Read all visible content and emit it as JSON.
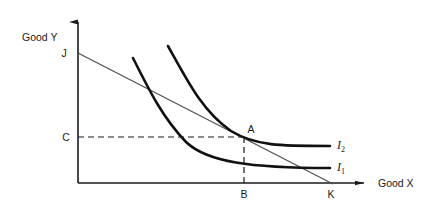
{
  "figure": {
    "type": "economics-indifference-curve-diagram",
    "background_color": "#ffffff",
    "line_color": "#1a1a1a",
    "curve_color": "#111111",
    "budget_line_color": "#555555"
  },
  "axes": {
    "y_axis_label": "Good Y",
    "x_axis_label": "Good X",
    "origin": {
      "x": 78,
      "y": 183
    },
    "y_axis_top": 14,
    "x_axis_right": 372
  },
  "points": [
    {
      "id": "J",
      "label": "J",
      "desc": "budget-line y-intercept",
      "x": 78,
      "y": 53
    },
    {
      "id": "K",
      "label": "K",
      "desc": "budget-line x-intercept",
      "x": 332,
      "y": 183
    },
    {
      "id": "A",
      "label": "A",
      "desc": "tangency of budget line with I2",
      "x": 244,
      "y": 137
    },
    {
      "id": "B",
      "label": "B",
      "desc": "x-axis projection of A",
      "x": 244,
      "y": 183
    },
    {
      "id": "C",
      "label": "C",
      "desc": "y-axis projection of A",
      "x": 78,
      "y": 137
    }
  ],
  "curves": [
    {
      "id": "I1",
      "label": "I",
      "subscript": "1",
      "label_x": 337,
      "label_y": 171,
      "desc": "lower indifference curve",
      "path": "M 133 58 C 150 92, 163 118, 186 142 C 207 162, 250 168, 330 168"
    },
    {
      "id": "I2",
      "label": "I",
      "subscript": "2",
      "label_x": 337,
      "label_y": 149,
      "desc": "higher indifference curve, tangent to budget line at A",
      "path": "M 168 46 C 188 82, 203 112, 231 131 C 256 146, 280 146, 330 146"
    }
  ],
  "budget_line": {
    "id": "JK",
    "desc": "budget constraint from J to K",
    "from": {
      "x": 78,
      "y": 53
    },
    "to": {
      "x": 332,
      "y": 183
    }
  },
  "guides": [
    {
      "id": "horizontal-dashed-CA",
      "desc": "dashed line from C on Y axis to point A",
      "x1": 78,
      "y1": 137,
      "x2": 244,
      "y2": 137
    },
    {
      "id": "vertical-dashed-AB",
      "desc": "dashed line from point A down to B on X axis",
      "x1": 244,
      "y1": 137,
      "x2": 244,
      "y2": 183
    }
  ]
}
